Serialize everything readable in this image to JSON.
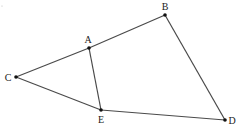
{
  "diagram": {
    "type": "geometry-figure",
    "stroke_color": "#4a4a4a",
    "point_color": "#111111",
    "points": [
      {
        "id": "A",
        "label": "A",
        "x": 89,
        "y": 48,
        "lx": 88,
        "ly": 43
      },
      {
        "id": "B",
        "label": "B",
        "x": 165,
        "y": 15,
        "lx": 165,
        "ly": 10
      },
      {
        "id": "C",
        "label": "C",
        "x": 16,
        "y": 77,
        "lx": 8,
        "ly": 81
      },
      {
        "id": "D",
        "label": "D",
        "x": 225,
        "y": 120,
        "lx": 232,
        "ly": 124
      },
      {
        "id": "E",
        "label": "E",
        "x": 101,
        "y": 110,
        "lx": 101,
        "ly": 123
      }
    ],
    "segments": [
      {
        "from": "C",
        "to": "A"
      },
      {
        "from": "A",
        "to": "B"
      },
      {
        "from": "B",
        "to": "D"
      },
      {
        "from": "D",
        "to": "E"
      },
      {
        "from": "E",
        "to": "C"
      },
      {
        "from": "A",
        "to": "E"
      }
    ]
  }
}
